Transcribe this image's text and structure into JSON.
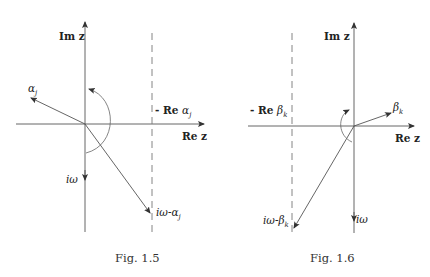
{
  "figures": [
    {
      "caption": "Fig. 1.5",
      "axis_labels": {
        "imaginary": "Im  z",
        "real": "Re z"
      },
      "dashed_line_label": {
        "prefix": "- Re ",
        "symbol": "α",
        "subscript": "j"
      },
      "vectors": [
        {
          "label": "α",
          "subscript": "j"
        },
        {
          "label": "iω",
          "subscript": ""
        },
        {
          "label": "iω-α",
          "subscript": "j"
        }
      ]
    },
    {
      "caption": "Fig. 1.6",
      "axis_labels": {
        "imaginary": "Im  z",
        "real": "Re z"
      },
      "dashed_line_label": {
        "prefix": "- Re ",
        "symbol": "β",
        "subscript": "k"
      },
      "vectors": [
        {
          "label": "β",
          "subscript": "k"
        },
        {
          "label": "iω",
          "subscript": ""
        },
        {
          "label": "iω-β",
          "subscript": "k"
        }
      ]
    }
  ],
  "colors": {
    "line": "#555555",
    "text": "#222222",
    "background": "#ffffff"
  }
}
